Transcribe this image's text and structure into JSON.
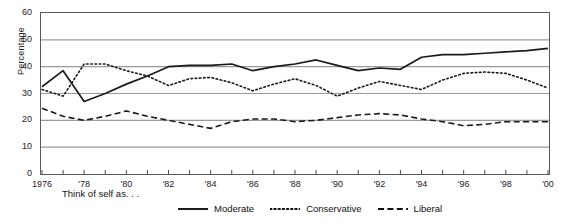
{
  "chart_data": {
    "type": "line",
    "title": "",
    "xlabel": "",
    "ylabel": "Percentage",
    "caption": "Think of self as. . .",
    "xlim": [
      1976,
      2000
    ],
    "ylim": [
      0,
      60
    ],
    "grid": "horizontal",
    "legend_position": "bottom",
    "yticks": [
      0,
      10,
      20,
      30,
      40,
      50,
      60
    ],
    "ytick_labels": [
      "0",
      "10",
      "20",
      "30",
      "40",
      "50",
      "60"
    ],
    "x": [
      1976,
      1977,
      1978,
      1979,
      1980,
      1981,
      1982,
      1983,
      1984,
      1985,
      1986,
      1987,
      1988,
      1989,
      1990,
      1991,
      1992,
      1993,
      1994,
      1995,
      1996,
      1997,
      1998,
      1999,
      2000
    ],
    "xtick_labels": [
      "1976",
      "",
      "'78",
      "",
      "'80",
      "",
      "'82",
      "",
      "'84",
      "",
      "'86",
      "",
      "'88",
      "",
      "'90",
      "",
      "'92",
      "",
      "'94",
      "",
      "'96",
      "",
      "'98",
      "",
      "'00"
    ],
    "series": [
      {
        "name": "Moderate",
        "style": "solid",
        "color": "#1a1a1a",
        "values": [
          32.5,
          38.5,
          27.0,
          30.0,
          33.5,
          36.5,
          40.0,
          40.5,
          40.5,
          41.0,
          38.5,
          40.0,
          41.0,
          42.5,
          40.5,
          38.5,
          39.5,
          39.0,
          43.5,
          44.5,
          44.5,
          45.0,
          45.5,
          46.0,
          46.8
        ]
      },
      {
        "name": "Conservative",
        "style": "dotted",
        "color": "#1a1a1a",
        "values": [
          31.5,
          29.0,
          41.0,
          41.0,
          38.5,
          36.5,
          33.0,
          35.5,
          36.0,
          34.0,
          31.0,
          33.5,
          35.5,
          33.0,
          29.0,
          32.0,
          34.5,
          33.0,
          31.5,
          35.0,
          37.5,
          38.0,
          37.5,
          35.0,
          32.0
        ]
      },
      {
        "name": "Liberal",
        "style": "dashed",
        "color": "#1a1a1a",
        "values": [
          24.5,
          21.5,
          20.0,
          21.5,
          23.5,
          21.5,
          20.0,
          18.5,
          17.0,
          19.5,
          20.5,
          20.5,
          19.5,
          20.0,
          21.0,
          22.0,
          22.5,
          22.0,
          20.5,
          19.5,
          18.0,
          18.5,
          19.5,
          19.5,
          19.5
        ]
      }
    ]
  },
  "legend": {
    "items": [
      {
        "label": "Moderate",
        "style": "solid"
      },
      {
        "label": "Conservative",
        "style": "dotted"
      },
      {
        "label": "Liberal",
        "style": "dashed"
      }
    ]
  }
}
